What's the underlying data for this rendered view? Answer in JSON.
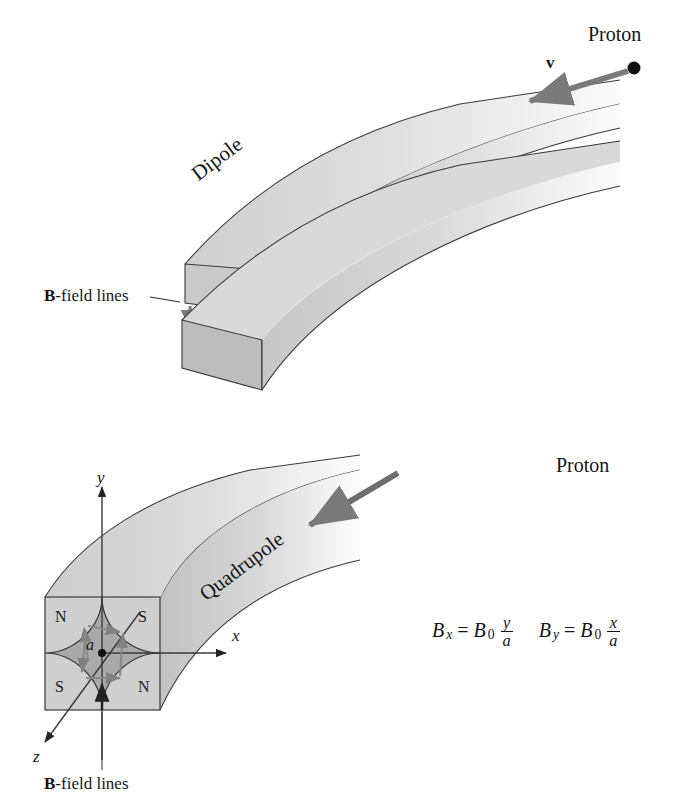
{
  "figure": {
    "background_color": "#ffffff",
    "ink_color": "#1a1a1a",
    "arrow_color": "#6e6e6e",
    "magnet_fill_light": "#e6e6e6",
    "magnet_fill_mid": "#d2d2d2",
    "magnet_fill_dark": "#b9b9b9"
  },
  "dipole": {
    "label": "Dipole",
    "proton_label": "Proton",
    "velocity_label": "v",
    "bfield_label_bold": "B",
    "bfield_label_rest": "-field lines",
    "field_arrow_count": 4,
    "field_arrow_direction": "down"
  },
  "quadrupole": {
    "label": "Quadrupole",
    "proton_label": "Proton",
    "bfield_label_bold": "B",
    "bfield_label_rest": "-field lines",
    "aperture_label": "a",
    "axes": [
      {
        "name": "y-axis",
        "label": "y"
      },
      {
        "name": "x-axis",
        "label": "x"
      },
      {
        "name": "z-axis",
        "label": "z"
      }
    ],
    "poles": [
      {
        "name": "pole-top-left",
        "label": "N",
        "quadrant": "top-left"
      },
      {
        "name": "pole-top-right",
        "label": "S",
        "quadrant": "top-right"
      },
      {
        "name": "pole-bottom-left",
        "label": "S",
        "quadrant": "bottom-left"
      },
      {
        "name": "pole-bottom-right",
        "label": "N",
        "quadrant": "bottom-right"
      }
    ]
  },
  "formulas": {
    "bx": {
      "lhs_var": "B",
      "lhs_sub": "x",
      "equals": "=",
      "rhs_var": "B",
      "rhs_sub": "0",
      "numerator": "y",
      "denominator": "a"
    },
    "by": {
      "lhs_var": "B",
      "lhs_sub": "y",
      "equals": "=",
      "rhs_var": "B",
      "rhs_sub": "0",
      "numerator": "x",
      "denominator": "a"
    }
  }
}
